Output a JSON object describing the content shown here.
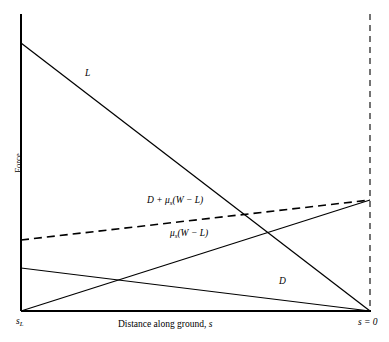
{
  "figure": {
    "background": "#ffffff",
    "line_color": "#000000",
    "width": 389,
    "height": 342
  },
  "axes": {
    "ylabel": "Force",
    "xlabel_prefix": "Distance along ground, ",
    "xlabel_var": "s",
    "xtick_left_base": "s",
    "xtick_left_sub": "L",
    "xtick_right": "s = 0"
  },
  "annotations": {
    "lift": "L",
    "drag": "D",
    "sum_prefix": "D + ",
    "sum_mu": "μ",
    "sum_mu_sub": "s",
    "sum_tail": "(W − L)",
    "friction_mu": "μ",
    "friction_mu_sub": "s",
    "friction_tail": "(W − L)"
  },
  "chart_data": {
    "type": "line",
    "title": "",
    "xlabel": "Distance along ground, s",
    "ylabel": "Force",
    "xlim": [
      0,
      1
    ],
    "ylim": [
      0,
      1
    ],
    "grid": false,
    "legend": "inline-annotations",
    "x_axis_direction": "s decreases left to right; left end is s_L, right end is s = 0",
    "x_tick_labels": [
      "s_L",
      "s = 0"
    ],
    "series": [
      {
        "name": "L",
        "label": "L",
        "style": "solid",
        "description": "Lift force decreasing linearly from maximum at s_L to zero at s = 0",
        "points_px": [
          [
            21,
            43
          ],
          [
            370,
            311
          ]
        ],
        "points_norm": [
          [
            0.0,
            0.902
          ],
          [
            1.0,
            0.0
          ]
        ]
      },
      {
        "name": "D",
        "label": "D",
        "style": "solid",
        "description": "Drag force decreasing slightly from s_L to zero at s = 0",
        "points_px": [
          [
            21,
            268
          ],
          [
            370,
            311
          ]
        ],
        "points_norm": [
          [
            0.0,
            0.145
          ],
          [
            1.0,
            0.0
          ]
        ]
      },
      {
        "name": "mu_s(W-L)",
        "label": "μₛ(W − L)",
        "style": "solid",
        "description": "Friction force increasing from near zero at s_L to maximum at s = 0",
        "points_px": [
          [
            21,
            311
          ],
          [
            370,
            200
          ]
        ],
        "points_norm": [
          [
            0.0,
            0.0
          ],
          [
            1.0,
            0.374
          ]
        ]
      },
      {
        "name": "D + mu_s(W-L)",
        "label": "D + μₛ(W − L)",
        "style": "dashed",
        "description": "Total braking force, sum of drag and friction",
        "points_px": [
          [
            21,
            240
          ],
          [
            370,
            200
          ]
        ],
        "points_norm": [
          [
            0.0,
            0.239
          ],
          [
            1.0,
            0.374
          ]
        ]
      }
    ],
    "boundaries": [
      {
        "name": "s-zero-line",
        "style": "dashed",
        "orientation": "vertical",
        "x_px": 370,
        "description": "Vertical dashed line marking s = 0"
      }
    ]
  }
}
